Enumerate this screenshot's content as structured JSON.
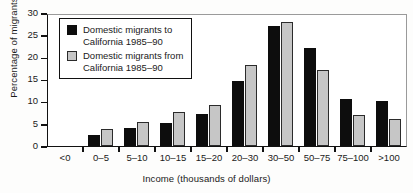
{
  "chart_data": {
    "type": "bar",
    "title": "",
    "xlabel": "Income (thousands of dollars)",
    "ylabel": "Percentage of migrants",
    "categories": [
      "<0",
      "0–5",
      "5–10",
      "10–15",
      "15–20",
      "20–30",
      "30–50",
      "50–75",
      "75–100",
      ">100"
    ],
    "series": [
      {
        "name": "Domestic migrants to California 1985–90",
        "color": "#0d0d0d",
        "values": [
          0,
          2.5,
          4.0,
          5.1,
          7.3,
          14.7,
          27.0,
          22.0,
          10.5,
          10.1
        ]
      },
      {
        "name": "Domestic migrants from California 1985–90",
        "color": "#c6c6c6",
        "values": [
          0,
          3.9,
          5.4,
          7.7,
          9.2,
          18.3,
          28.0,
          17.2,
          7.0,
          6.2
        ]
      }
    ],
    "ylim": [
      0,
      30
    ],
    "yticks": [
      0,
      5,
      10,
      15,
      20,
      25,
      30
    ],
    "ytick_labels": [
      "0",
      "5",
      "10",
      "15",
      "20",
      "25",
      "30"
    ],
    "grid": false,
    "legend_position": "upper-left"
  },
  "legend": {
    "entries": [
      {
        "line1": "Domestic migrants to",
        "line2": "California 1985–90"
      },
      {
        "line1": "Domestic migrants from",
        "line2": "California 1985–90"
      }
    ]
  }
}
